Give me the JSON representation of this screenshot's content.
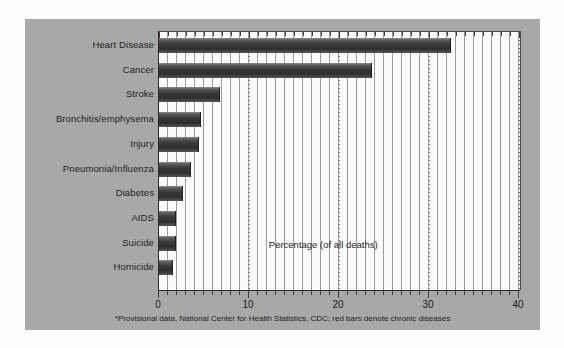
{
  "figure": {
    "annotation": "Percentage (of all deaths)",
    "footnote": "*Provisional data, National Center for Health Statistics, CDC; red bars denote chronic diseases",
    "panel_color": "#a8a8a8",
    "plot_background": "#fbfbfb",
    "bar_color": "#333333",
    "axis_color": "#2b2b2b"
  },
  "chart_data": {
    "type": "bar",
    "orientation": "horizontal",
    "title": "",
    "xlabel": "Percentage (of all deaths)",
    "ylabel": "",
    "xlim": [
      0,
      40
    ],
    "xticks": [
      0,
      10,
      20,
      30,
      40
    ],
    "xtick_labels": [
      "0",
      "10",
      "20",
      "30",
      "40"
    ],
    "minor_tick_interval": 1,
    "grid": true,
    "legend": "none",
    "categories": [
      "Heart Disease",
      "Cancer",
      "Stroke",
      "Bronchitis/emphysema",
      "Injury",
      "Pneumonia/Influenza",
      "Diabetes",
      "AIDS",
      "Suicide",
      "Homicide"
    ],
    "values": [
      32.4,
      23.7,
      6.8,
      4.7,
      4.4,
      3.6,
      2.7,
      1.9,
      1.9,
      1.5
    ],
    "series": [
      {
        "name": "Percentage of all deaths",
        "values": [
          32.4,
          23.7,
          6.8,
          4.7,
          4.4,
          3.6,
          2.7,
          1.9,
          1.9,
          1.5
        ]
      }
    ]
  }
}
